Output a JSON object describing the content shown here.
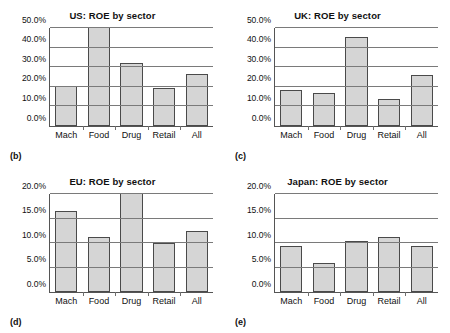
{
  "figure": {
    "panels": [
      {
        "key": "b",
        "panel_label": "(b)",
        "title": "US: ROE by sector",
        "categories": [
          "Mach",
          "Food",
          "Drug",
          "Retail",
          "All"
        ],
        "values": [
          20.2,
          62.0,
          32.4,
          19.4,
          26.4
        ],
        "clipped": [
          false,
          true,
          false,
          false,
          false
        ],
        "ylim": [
          0,
          50
        ],
        "ytick_labels": [
          "0.0%",
          "10.0%",
          "20.0%",
          "30.0%",
          "40.0%",
          "50.0%"
        ],
        "ytick_values": [
          0,
          10,
          20,
          30,
          40,
          50
        ]
      },
      {
        "key": "c",
        "panel_label": "(c)",
        "title": "UK: ROE by sector",
        "categories": [
          "Mach",
          "Food",
          "Drug",
          "Retail",
          "All"
        ],
        "values": [
          18.3,
          16.8,
          45.3,
          14.0,
          25.8
        ],
        "clipped": [
          false,
          false,
          false,
          false,
          false
        ],
        "ylim": [
          0,
          50
        ],
        "ytick_labels": [
          "0.0%",
          "10.0%",
          "20.0%",
          "30.0%",
          "40.0%",
          "50.0%"
        ],
        "ytick_values": [
          0,
          10,
          20,
          30,
          40,
          50
        ]
      },
      {
        "key": "d",
        "panel_label": "(d)",
        "title": "EU: ROE by sector",
        "categories": [
          "Mach",
          "Food",
          "Drug",
          "Retail",
          "All"
        ],
        "values": [
          16.6,
          11.3,
          24.5,
          10.0,
          12.5
        ],
        "clipped": [
          false,
          false,
          true,
          false,
          false
        ],
        "ylim": [
          0,
          20
        ],
        "ytick_labels": [
          "0.0%",
          "5.0%",
          "10.0%",
          "15.0%",
          "20.0%"
        ],
        "ytick_values": [
          0,
          5,
          10,
          15,
          20
        ]
      },
      {
        "key": "e",
        "panel_label": "(e)",
        "title": "Japan: ROE by sector",
        "categories": [
          "Mach",
          "Food",
          "Drug",
          "Retail",
          "All"
        ],
        "values": [
          9.4,
          6.0,
          10.5,
          11.2,
          9.3
        ],
        "clipped": [
          false,
          false,
          false,
          false,
          false
        ],
        "ylim": [
          0,
          20
        ],
        "ytick_labels": [
          "0.0%",
          "5.0%",
          "10.0%",
          "15.0%",
          "20.0%"
        ],
        "ytick_values": [
          0,
          5,
          10,
          15,
          20
        ]
      }
    ]
  },
  "chart_data": [
    {
      "type": "bar",
      "title": "US: ROE by sector",
      "panel_label": "(b)",
      "categories": [
        "Mach",
        "Food",
        "Drug",
        "Retail",
        "All"
      ],
      "values": [
        20.2,
        62.0,
        32.4,
        19.4,
        26.4
      ],
      "note": "Food bar exceeds the axis maximum and is clipped at 50.0%",
      "xlabel": "",
      "ylabel": "",
      "ylim": [
        0,
        50
      ],
      "ytick_labels": [
        "0.0%",
        "10.0%",
        "20.0%",
        "30.0%",
        "40.0%",
        "50.0%"
      ],
      "grid": "horizontal",
      "legend": "none"
    },
    {
      "type": "bar",
      "title": "UK: ROE by sector",
      "panel_label": "(c)",
      "categories": [
        "Mach",
        "Food",
        "Drug",
        "Retail",
        "All"
      ],
      "values": [
        18.3,
        16.8,
        45.3,
        14.0,
        25.8
      ],
      "xlabel": "",
      "ylabel": "",
      "ylim": [
        0,
        50
      ],
      "ytick_labels": [
        "0.0%",
        "10.0%",
        "20.0%",
        "30.0%",
        "40.0%",
        "50.0%"
      ],
      "grid": "horizontal",
      "legend": "none"
    },
    {
      "type": "bar",
      "title": "EU: ROE by sector",
      "panel_label": "(d)",
      "categories": [
        "Mach",
        "Food",
        "Drug",
        "Retail",
        "All"
      ],
      "values": [
        16.6,
        11.3,
        24.5,
        10.0,
        12.5
      ],
      "note": "Drug bar exceeds the axis maximum and is clipped at 20.0%",
      "xlabel": "",
      "ylabel": "",
      "ylim": [
        0,
        20
      ],
      "ytick_labels": [
        "0.0%",
        "5.0%",
        "10.0%",
        "15.0%",
        "20.0%"
      ],
      "grid": "horizontal",
      "legend": "none"
    },
    {
      "type": "bar",
      "title": "Japan: ROE by sector",
      "panel_label": "(e)",
      "categories": [
        "Mach",
        "Food",
        "Drug",
        "Retail",
        "All"
      ],
      "values": [
        9.4,
        6.0,
        10.5,
        11.2,
        9.3
      ],
      "xlabel": "",
      "ylabel": "",
      "ylim": [
        0,
        20
      ],
      "ytick_labels": [
        "0.0%",
        "5.0%",
        "10.0%",
        "15.0%",
        "20.0%"
      ],
      "grid": "horizontal",
      "legend": "none"
    }
  ],
  "style": {
    "bar_fill": "#d5d5d5",
    "bar_stroke": "#4a4a4a",
    "axis_color": "#555555",
    "grid_color": "#7a7a7a",
    "background": "#ffffff",
    "text_color": "#111111"
  }
}
